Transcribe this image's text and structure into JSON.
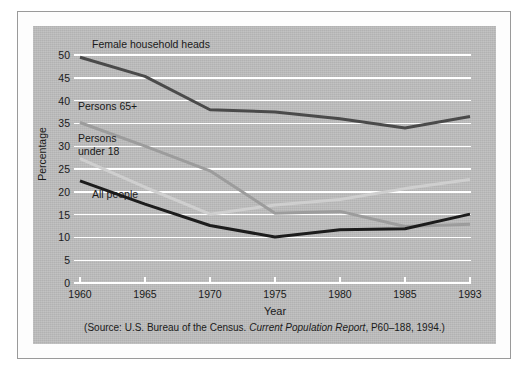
{
  "figure": {
    "panel_color": "#bdbdbd",
    "grid_color": "#ffffff",
    "axis_color": "#ffffff",
    "frame_color": "#9a9a9a"
  },
  "axes": {
    "ylabel": "Percentage",
    "xlabel": "Year",
    "yticks": [
      "0",
      "5",
      "10",
      "15",
      "20",
      "25",
      "30",
      "35",
      "40",
      "45",
      "50"
    ],
    "xticks": [
      "1960",
      "1965",
      "1970",
      "1975",
      "1980",
      "1985",
      "1993"
    ]
  },
  "series_labels": {
    "female": "Female household heads",
    "elderly": "Persons 65+",
    "children": "Persons\nunder 18",
    "all": "All people"
  },
  "source": {
    "prefix": "(Source: U.S. Bureau of the Census. ",
    "italic": "Current Population Report",
    "suffix": ", P60–188, 1994.)"
  },
  "chart_data": {
    "type": "line",
    "title": "",
    "xlabel": "Year",
    "ylabel": "Percentage",
    "x": [
      "1960",
      "1965",
      "1970",
      "1975",
      "1980",
      "1985",
      "1993"
    ],
    "xlim": [
      "1960",
      "1993"
    ],
    "ylim": [
      0,
      50
    ],
    "ytick_step": 5,
    "grid": true,
    "grid_orientation": "horizontal",
    "legend": "in-plot labels",
    "series": [
      {
        "name": "Female household heads",
        "color": "#4a4a4a",
        "linewidth": 3,
        "values": [
          49.5,
          45.3,
          38.0,
          37.5,
          36.0,
          34.0,
          36.5
        ]
      },
      {
        "name": "Persons 65+",
        "color": "#9c9c9c",
        "linewidth": 3,
        "values": [
          35.2,
          30.0,
          24.6,
          15.3,
          15.7,
          12.4,
          12.9
        ]
      },
      {
        "name": "Persons under 18",
        "color": "#cfcfcf",
        "linewidth": 3,
        "values": [
          27.3,
          21.0,
          15.1,
          17.1,
          18.3,
          20.7,
          22.7
        ]
      },
      {
        "name": "All people",
        "color": "#1c1c1c",
        "linewidth": 3,
        "values": [
          22.4,
          17.3,
          12.6,
          10.1,
          11.7,
          11.9,
          15.1
        ]
      }
    ],
    "annotations": [
      {
        "text": "Female household heads",
        "series": "Female household heads"
      },
      {
        "text": "Persons 65+",
        "series": "Persons 65+"
      },
      {
        "text": "Persons under 18",
        "series": "Persons under 18"
      },
      {
        "text": "All people",
        "series": "All people"
      }
    ]
  }
}
